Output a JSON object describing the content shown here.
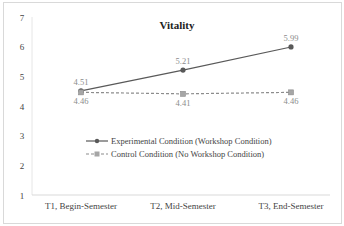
{
  "chart_data": {
    "type": "line",
    "title": "Vitality",
    "xlabel": "",
    "ylabel": "",
    "categories": [
      "T1, Begin-Semester",
      "T2, Mid-Semester",
      "T3, End-Semester"
    ],
    "ylim": [
      1,
      7
    ],
    "yticks": [
      1,
      2,
      3,
      4,
      5,
      6,
      7
    ],
    "grid": false,
    "legend_position": "inside-center",
    "series": [
      {
        "name": "Experimental Condition (Workshop Condition)",
        "values": [
          4.51,
          5.21,
          5.99
        ],
        "labels": [
          "4.51",
          "5.21",
          "5.99"
        ],
        "style": "solid",
        "marker": "diamond",
        "color": "#595959"
      },
      {
        "name": "Control Condition (No Workshop Condition)",
        "values": [
          4.46,
          4.41,
          4.46
        ],
        "labels": [
          "4.46",
          "4.41",
          "4.46"
        ],
        "style": "dashed",
        "marker": "square",
        "color": "#8c8c8c"
      }
    ]
  }
}
